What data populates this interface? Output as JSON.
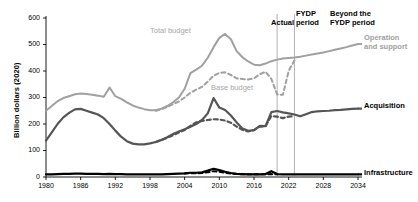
{
  "chart_data": {
    "type": "line",
    "title": "",
    "xlabel": "",
    "ylabel": "Billion dollars (2020)",
    "xlim": [
      1980,
      2034
    ],
    "ylim": [
      0,
      600
    ],
    "grid": false,
    "legend_position": "right-inline",
    "xticks": [
      "1980",
      "1986",
      "1992",
      "1998",
      "2004",
      "2010",
      "2016",
      "2022",
      "2028",
      "2034"
    ],
    "xtick_values": [
      1980,
      1986,
      1992,
      1998,
      2004,
      2010,
      2016,
      2022,
      2028,
      2034
    ],
    "yticks": [
      "0",
      "100",
      "200",
      "300",
      "400",
      "500",
      "600"
    ],
    "ytick_values": [
      0,
      100,
      200,
      300,
      400,
      500,
      600
    ],
    "annotations": [
      {
        "name": "actual-period",
        "text": "Actual",
        "x": 2015.0
      },
      {
        "name": "fydp-period",
        "text": "FYDP period",
        "x": 2021.5
      },
      {
        "name": "beyond-fydp-period",
        "text": "Beyond the FYDP period",
        "x": 2028.0
      },
      {
        "name": "total-budget-inline",
        "text": "Total budget",
        "x": 1999.0,
        "y": 560
      },
      {
        "name": "base-budget-inline",
        "text": "Base budget",
        "x": 2008.5,
        "y": 320
      }
    ],
    "dividers": [
      {
        "name": "actual-fydp-divider",
        "x": 2020.0
      },
      {
        "name": "fydp-beyond-divider",
        "x": 2023.0
      }
    ],
    "series": [
      {
        "name": "Operation and support",
        "label": "Operation and support",
        "color": "#a0a0a0",
        "style": "solid",
        "width": 2.0,
        "x": [
          1980,
          1981,
          1982,
          1983,
          1984,
          1985,
          1986,
          1987,
          1988,
          1989,
          1990,
          1991,
          1992,
          1993,
          1994,
          1995,
          1996,
          1997,
          1998,
          1999,
          2000,
          2001,
          2002,
          2003,
          2004,
          2005,
          2006,
          2007,
          2008,
          2009,
          2010,
          2011,
          2012,
          2013,
          2014,
          2015,
          2016,
          2017,
          2018,
          2019,
          2020,
          2021,
          2022,
          2023,
          2024,
          2025,
          2026,
          2027,
          2028,
          2029,
          2030,
          2031,
          2032,
          2033,
          2034
        ],
        "values": [
          250,
          268,
          286,
          298,
          305,
          312,
          315,
          313,
          310,
          307,
          303,
          338,
          305,
          295,
          282,
          270,
          262,
          256,
          252,
          252,
          258,
          268,
          282,
          300,
          333,
          392,
          405,
          420,
          450,
          490,
          525,
          540,
          520,
          475,
          452,
          436,
          424,
          422,
          428,
          437,
          443,
          447,
          449,
          451,
          454,
          458,
          462,
          466,
          470,
          475,
          480,
          485,
          490,
          496,
          502
        ]
      },
      {
        "name": "Base budget",
        "label": "Base budget",
        "color": "#a0a0a0",
        "style": "dashed",
        "width": 2.0,
        "x": [
          1999,
          2000,
          2001,
          2002,
          2003,
          2004,
          2005,
          2006,
          2007,
          2008,
          2009,
          2010,
          2011,
          2012,
          2013,
          2014,
          2015,
          2016,
          2017,
          2018,
          2019,
          2020,
          2021,
          2022,
          2023
        ],
        "values": [
          250,
          256,
          264,
          275,
          285,
          300,
          318,
          330,
          340,
          360,
          382,
          393,
          395,
          385,
          372,
          370,
          368,
          372,
          388,
          397,
          370,
          312,
          310,
          400,
          440
        ]
      },
      {
        "name": "Acquisition",
        "label": "Acquisition",
        "color": "#555555",
        "style": "solid",
        "width": 2.2,
        "x": [
          1980,
          1981,
          1982,
          1983,
          1984,
          1985,
          1986,
          1987,
          1988,
          1989,
          1990,
          1991,
          1992,
          1993,
          1994,
          1995,
          1996,
          1997,
          1998,
          1999,
          2000,
          2001,
          2002,
          2003,
          2004,
          2005,
          2006,
          2007,
          2008,
          2009,
          2010,
          2011,
          2012,
          2013,
          2014,
          2015,
          2016,
          2017,
          2018,
          2019,
          2020,
          2021,
          2022,
          2023,
          2024,
          2025,
          2026,
          2027,
          2028,
          2029,
          2030,
          2031,
          2032,
          2033,
          2034
        ],
        "values": [
          137,
          168,
          200,
          225,
          242,
          255,
          257,
          250,
          243,
          236,
          222,
          200,
          175,
          152,
          135,
          126,
          123,
          123,
          127,
          132,
          140,
          150,
          162,
          172,
          180,
          190,
          200,
          215,
          240,
          298,
          262,
          253,
          232,
          206,
          183,
          174,
          177,
          193,
          192,
          245,
          249,
          244,
          240,
          236,
          229,
          237,
          245,
          248,
          249,
          250,
          252,
          253,
          255,
          257,
          258
        ]
      },
      {
        "name": "Acquisition base",
        "label": "",
        "color": "#555555",
        "style": "dashed",
        "width": 2.2,
        "x": [
          1999,
          2000,
          2001,
          2002,
          2003,
          2004,
          2005,
          2006,
          2007,
          2008,
          2009,
          2010,
          2011,
          2012,
          2013,
          2014,
          2015,
          2016,
          2017,
          2018,
          2019,
          2020,
          2021,
          2022,
          2023
        ],
        "values": [
          132,
          140,
          148,
          158,
          168,
          177,
          193,
          206,
          212,
          215,
          218,
          217,
          213,
          205,
          190,
          178,
          172,
          177,
          190,
          192,
          230,
          228,
          222,
          228,
          229
        ]
      },
      {
        "name": "Infrastructure",
        "label": "Infrastructure",
        "color": "#000000",
        "style": "solid",
        "width": 2.2,
        "x": [
          1980,
          1981,
          1982,
          1983,
          1984,
          1985,
          1986,
          1987,
          1988,
          1989,
          1990,
          1991,
          1992,
          1993,
          1994,
          1995,
          1996,
          1997,
          1998,
          1999,
          2000,
          2001,
          2002,
          2003,
          2004,
          2005,
          2006,
          2007,
          2008,
          2009,
          2010,
          2011,
          2012,
          2013,
          2014,
          2015,
          2016,
          2017,
          2018,
          2019,
          2020,
          2021,
          2022,
          2023,
          2024,
          2025,
          2026,
          2027,
          2028,
          2029,
          2030,
          2031,
          2032,
          2033,
          2034
        ],
        "values": [
          10,
          10,
          11,
          12,
          12,
          13,
          13,
          12,
          12,
          12,
          11,
          12,
          11,
          11,
          10,
          10,
          10,
          10,
          10,
          10,
          10,
          11,
          12,
          13,
          14,
          16,
          16,
          18,
          24,
          31,
          26,
          20,
          15,
          12,
          11,
          10,
          10,
          10,
          11,
          22,
          11,
          10,
          10,
          10,
          10,
          10,
          10,
          10,
          10,
          10,
          10,
          10,
          10,
          10,
          10
        ]
      },
      {
        "name": "Infrastructure base",
        "label": "",
        "color": "#000000",
        "style": "dashed",
        "width": 2.0,
        "x": [
          2004,
          2005,
          2006,
          2007,
          2008,
          2009,
          2010,
          2011,
          2012,
          2013,
          2014,
          2015,
          2016,
          2017,
          2018,
          2019,
          2020
        ],
        "values": [
          13,
          14,
          14,
          15,
          18,
          22,
          20,
          16,
          13,
          11,
          10,
          10,
          10,
          10,
          10,
          11,
          10
        ]
      }
    ]
  },
  "axis": {
    "ylabel": "Billion dollars (2020)"
  }
}
